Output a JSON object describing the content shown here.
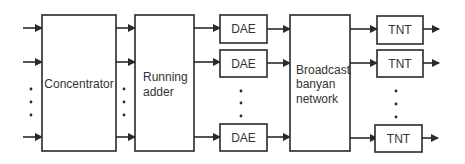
{
  "diagram": {
    "blocks": {
      "concentrator": {
        "label": "Concentrator"
      },
      "running_adder": {
        "label_lines": [
          "Running",
          "adder"
        ]
      },
      "dae": {
        "label": "DAE",
        "count_shown": 3
      },
      "broadcast": {
        "label_lines": [
          "Broadcast",
          "banyan",
          "network"
        ]
      },
      "tnt": {
        "label": "TNT",
        "count_shown": 3
      }
    },
    "colors": {
      "stroke": "#2a2a2a",
      "text": "#333333",
      "background": "#ffffff"
    }
  }
}
